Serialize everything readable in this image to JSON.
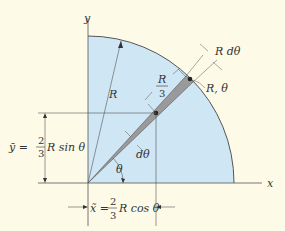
{
  "figure": {
    "axes": {
      "x_label": "x",
      "y_label": "y"
    },
    "radius_label": "R",
    "point_label": "R, θ",
    "arc_width_label": "R dθ",
    "offset_label": {
      "num": "R",
      "den": "3"
    },
    "angle_label": "θ",
    "dangle_label": "dθ",
    "ybar": {
      "lhs": "ȳ =",
      "num": "2",
      "den": "3",
      "rhs": "R sin θ"
    },
    "xbar": {
      "lhs": "x̃ =",
      "num": "2",
      "den": "3",
      "rhs": "R cos θ"
    },
    "colors": {
      "background": "#fdfbe8",
      "region_fill": "#cfe6f5",
      "element_fill": "#9a9a9a",
      "line": "#555555"
    }
  }
}
